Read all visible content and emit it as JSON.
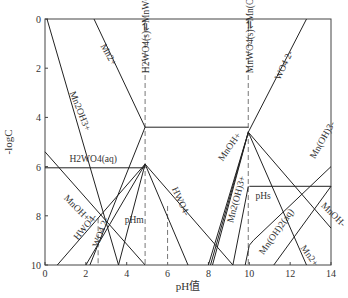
{
  "chart_data": {
    "type": "line",
    "title": "",
    "xlabel": "pH值",
    "ylabel": "-logC",
    "xlim": [
      0,
      14
    ],
    "ylim": [
      0,
      10
    ],
    "y_inverted": true,
    "xticks": [
      "0",
      "2",
      "4",
      "6",
      "8",
      "10",
      "12",
      "14"
    ],
    "yticks": [
      "0",
      "2",
      "4",
      "6",
      "8",
      "10"
    ],
    "grid": false,
    "series": [
      {
        "name": "Mn2OH3+",
        "points": [
          [
            0.1,
            0
          ],
          [
            3.6,
            10
          ]
        ]
      },
      {
        "name": "Mn2+ (left)",
        "points": [
          [
            2.4,
            0
          ],
          [
            4.9,
            4.4
          ]
        ]
      },
      {
        "name": "Mn2+ lower",
        "points": [
          [
            4.9,
            4.4
          ],
          [
            2.2,
            10
          ]
        ]
      },
      {
        "name": "H2WO4(s)-MnWO4(s) boundary top",
        "points": [
          [
            4.9,
            4.4
          ],
          [
            9.95,
            4.4
          ]
        ]
      },
      {
        "name": "H2WO4(aq)",
        "points": [
          [
            0,
            6.05
          ],
          [
            4.9,
            6.05
          ]
        ]
      },
      {
        "name": "MnOH+ (left)",
        "points": [
          [
            0,
            5.4
          ],
          [
            4.9,
            10
          ]
        ]
      },
      {
        "name": "HWO4- (left)",
        "points": [
          [
            0.6,
            10
          ],
          [
            4.9,
            5.9
          ]
        ]
      },
      {
        "name": "WO4 2- (left)",
        "points": [
          [
            2.0,
            10
          ],
          [
            4.9,
            5.9
          ]
        ]
      },
      {
        "name": "HWO4- (right)",
        "points": [
          [
            4.9,
            5.9
          ],
          [
            7.0,
            10
          ]
        ]
      },
      {
        "name": "HWO4- dashed/right2",
        "points": [
          [
            4.9,
            5.9
          ],
          [
            9.2,
            10
          ]
        ]
      },
      {
        "name": "tungstate right from pHm",
        "points": [
          [
            4.9,
            5.9
          ],
          [
            3.6,
            10
          ]
        ]
      },
      {
        "name": "MnOH+ (middle)",
        "points": [
          [
            8.1,
            10
          ],
          [
            9.95,
            4.6
          ]
        ]
      },
      {
        "name": "Mn2(OH)3+",
        "points": [
          [
            8.0,
            10
          ],
          [
            9.95,
            4.6
          ]
        ]
      },
      {
        "name": "MnWO4 down left",
        "points": [
          [
            9.95,
            4.6
          ],
          [
            8.2,
            10
          ]
        ]
      },
      {
        "name": "WO4 2- (right)",
        "points": [
          [
            9.95,
            4.6
          ],
          [
            12.8,
            0
          ]
        ]
      },
      {
        "name": "Mn2+ (right)",
        "points": [
          [
            9.95,
            4.6
          ],
          [
            12.8,
            10
          ]
        ]
      },
      {
        "name": "MnOH- right",
        "points": [
          [
            9.95,
            4.6
          ],
          [
            14,
            8.5
          ]
        ]
      },
      {
        "name": "pHs horizontal",
        "points": [
          [
            10,
            6.8
          ],
          [
            14,
            6.8
          ]
        ]
      },
      {
        "name": "Mn(OH)2(aq)",
        "points": [
          [
            9.8,
            10
          ],
          [
            10,
            9.2
          ],
          [
            10.2,
            9.0
          ],
          [
            14,
            6.0
          ]
        ]
      },
      {
        "name": "Mn(OH)3-",
        "points": [
          [
            11.2,
            10
          ],
          [
            14,
            6.8
          ]
        ]
      },
      {
        "name": "pHs left branch",
        "points": [
          [
            9.95,
            6.8
          ],
          [
            9.2,
            10
          ]
        ]
      }
    ],
    "vertical_dashed": [
      {
        "name": "pHm",
        "x": 4.9
      },
      {
        "name": "HWO4- boundary",
        "x": 6.0
      },
      {
        "name": "pHs",
        "x": 9.95
      },
      {
        "name": "left dashed",
        "x": 2.6
      }
    ],
    "annotations": [
      {
        "text": "Mn2+",
        "x": 2.7,
        "y": 1.1,
        "rotate": 60
      },
      {
        "text": "Mn2OH3+",
        "x": 1.2,
        "y": 3.0,
        "rotate": 68
      },
      {
        "text": "H2WO4(s)⇌MnWO4(s)",
        "x": 5.1,
        "y": 2.2,
        "rotate": -90
      },
      {
        "text": "MnWO4(s)⇌Mn(OH)2(s)",
        "x": 10.2,
        "y": 2.2,
        "rotate": -90
      },
      {
        "text": "WO4 2-",
        "x": 11.5,
        "y": 2.5,
        "rotate": -65
      },
      {
        "text": "H2WO4(aq)",
        "x": 1.2,
        "y": 5.8,
        "rotate": 0
      },
      {
        "text": "MnOH+",
        "x": 0.9,
        "y": 7.3,
        "rotate": 45
      },
      {
        "text": "HWO4-",
        "x": 1.6,
        "y": 9.0,
        "rotate": -50
      },
      {
        "text": "WO4 2-",
        "x": 2.6,
        "y": 9.3,
        "rotate": -70
      },
      {
        "text": "pHm",
        "x": 3.9,
        "y": 8.3,
        "rotate": 0
      },
      {
        "text": "HWO4-",
        "x": 6.2,
        "y": 6.9,
        "rotate": 65
      },
      {
        "text": "MnOH+",
        "x": 8.7,
        "y": 5.8,
        "rotate": -55
      },
      {
        "text": "Mn2(OH)3+",
        "x": 9.2,
        "y": 8.3,
        "rotate": -75
      },
      {
        "text": "pHs",
        "x": 10.3,
        "y": 7.3,
        "rotate": 0
      },
      {
        "text": "Mn(OH)2(aq)",
        "x": 10.7,
        "y": 9.6,
        "rotate": -55
      },
      {
        "text": "Mn(OH)3-",
        "x": 13.2,
        "y": 5.7,
        "rotate": -60
      },
      {
        "text": "MnOH-",
        "x": 13.5,
        "y": 7.6,
        "rotate": 45
      },
      {
        "text": "Mn2+",
        "x": 12.5,
        "y": 9.3,
        "rotate": 55
      }
    ]
  }
}
